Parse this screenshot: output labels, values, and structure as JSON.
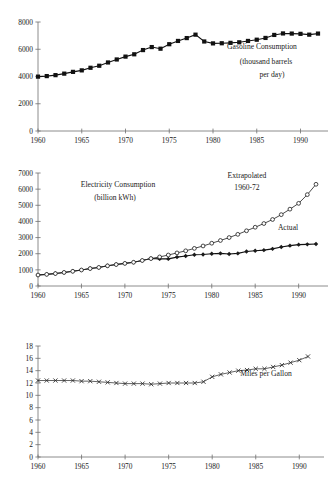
{
  "figure": {
    "title": "",
    "panel_count": 3
  },
  "chart_data": [
    {
      "id": "gasoline",
      "type": "line",
      "title": "Gasoline Consumption",
      "annotations": [
        "Gasoline Consumption",
        "(thousand barrels",
        "per day)"
      ],
      "xlabel": "",
      "ylabel": "",
      "units": "thousand barrels per day",
      "xlim": [
        1960,
        1992
      ],
      "ylim": [
        0,
        8000
      ],
      "xticks": [
        1960,
        1965,
        1970,
        1975,
        1980,
        1985,
        1990
      ],
      "yticks": [
        0,
        2000,
        4000,
        6000,
        8000
      ],
      "grid": false,
      "legend": "none",
      "marker": "filled-square",
      "x": [
        1960,
        1961,
        1962,
        1963,
        1964,
        1965,
        1966,
        1967,
        1968,
        1969,
        1970,
        1971,
        1972,
        1973,
        1974,
        1975,
        1976,
        1977,
        1978,
        1979,
        1980,
        1981,
        1982,
        1983,
        1984,
        1985,
        1986,
        1987,
        1988,
        1989,
        1990,
        1991,
        1992
      ],
      "values": [
        3990,
        4030,
        4100,
        4210,
        4340,
        4450,
        4640,
        4790,
        5030,
        5250,
        5460,
        5630,
        5940,
        6160,
        6040,
        6370,
        6610,
        6820,
        7070,
        6570,
        6430,
        6440,
        6470,
        6510,
        6610,
        6700,
        6830,
        7050,
        7160,
        7150,
        7130,
        7070,
        7150
      ]
    },
    {
      "id": "electricity",
      "type": "line",
      "title": "Electricity Consumption",
      "annotations": [
        "Electricity Consumption",
        "(billion kWh)",
        "Extrapolated",
        "1960-72",
        "Actual"
      ],
      "xlabel": "",
      "ylabel": "",
      "units": "billion kWh",
      "xlim": [
        1960,
        1992
      ],
      "ylim": [
        0,
        7000
      ],
      "xticks": [
        1960,
        1965,
        1970,
        1975,
        1980,
        1985,
        1990
      ],
      "yticks": [
        0,
        1000,
        2000,
        3000,
        4000,
        5000,
        6000,
        7000
      ],
      "grid": false,
      "legend": "inline-labels",
      "x": [
        1960,
        1961,
        1962,
        1963,
        1964,
        1965,
        1966,
        1967,
        1968,
        1969,
        1970,
        1971,
        1972,
        1973,
        1974,
        1975,
        1976,
        1977,
        1978,
        1979,
        1980,
        1981,
        1982,
        1983,
        1984,
        1985,
        1986,
        1987,
        1988,
        1989,
        1990,
        1991,
        1992
      ],
      "series": [
        {
          "name": "Actual",
          "marker": "filled-diamond",
          "values": [
            680,
            720,
            770,
            840,
            910,
            990,
            1080,
            1150,
            1250,
            1330,
            1400,
            1470,
            1580,
            1700,
            1680,
            1680,
            1790,
            1860,
            1940,
            1950,
            2000,
            2020,
            1980,
            2020,
            2140,
            2180,
            2220,
            2300,
            2420,
            2500,
            2560,
            2580,
            2600
          ]
        },
        {
          "name": "Extrapolated 1960-72",
          "marker": "open-circle",
          "values": [
            680,
            720,
            770,
            840,
            910,
            990,
            1080,
            1150,
            1250,
            1330,
            1400,
            1470,
            1580,
            1700,
            1800,
            1920,
            2050,
            2180,
            2330,
            2480,
            2650,
            2820,
            3000,
            3200,
            3420,
            3640,
            3870,
            4120,
            4420,
            4760,
            5120,
            5660,
            6300
          ]
        }
      ]
    },
    {
      "id": "mpg",
      "type": "line",
      "title": "Miles per Gallon",
      "annotations": [
        "Miles per Gallon"
      ],
      "xlabel": "",
      "ylabel": "",
      "units": "miles per gallon",
      "xlim": [
        1960,
        1991
      ],
      "ylim": [
        0,
        18
      ],
      "xticks": [
        1960,
        1965,
        1970,
        1975,
        1980,
        1985,
        1990
      ],
      "yticks": [
        0,
        2,
        4,
        6,
        8,
        10,
        12,
        14,
        16,
        18
      ],
      "grid": false,
      "legend": "none",
      "marker": "cross",
      "x": [
        1960,
        1961,
        1962,
        1963,
        1964,
        1965,
        1966,
        1967,
        1968,
        1969,
        1970,
        1971,
        1972,
        1973,
        1974,
        1975,
        1976,
        1977,
        1978,
        1979,
        1980,
        1981,
        1982,
        1983,
        1984,
        1985,
        1986,
        1987,
        1988,
        1989,
        1990,
        1991
      ],
      "values": [
        12.4,
        12.4,
        12.4,
        12.4,
        12.4,
        12.3,
        12.3,
        12.2,
        12.1,
        12.0,
        11.9,
        11.9,
        11.9,
        11.8,
        11.9,
        12.0,
        12.0,
        12.0,
        12.0,
        12.2,
        13.0,
        13.4,
        13.7,
        14.0,
        14.1,
        14.3,
        14.3,
        14.6,
        14.9,
        15.3,
        15.7,
        16.3
      ]
    }
  ],
  "panels": {
    "gasoline": {
      "annotation_line1": "Gasoline Consumption",
      "annotation_line2": "(thousand barrels",
      "annotation_line3": "per day)",
      "yticklabels": [
        "0",
        "2000",
        "4000",
        "6000",
        "8000"
      ],
      "xticklabels": [
        "1960",
        "1965",
        "1970",
        "1975",
        "1980",
        "1985",
        "1990"
      ]
    },
    "electricity": {
      "annotation_line1": "Electricity Consumption",
      "annotation_line2": "(billion kWh)",
      "annotation_extrap1": "Extrapolated",
      "annotation_extrap2": "1960-72",
      "annotation_actual": "Actual",
      "yticklabels": [
        "0",
        "1000",
        "2000",
        "3000",
        "4000",
        "5000",
        "6000",
        "7000"
      ],
      "xticklabels": [
        "1960",
        "1965",
        "1970",
        "1975",
        "1980",
        "1985",
        "1990"
      ]
    },
    "mpg": {
      "annotation_line1": "Miles per Gallon",
      "yticklabels": [
        "0",
        "2",
        "4",
        "6",
        "8",
        "10",
        "12",
        "14",
        "16",
        "18"
      ],
      "xticklabels": [
        "1960",
        "1965",
        "1970",
        "1975",
        "1980",
        "1985",
        "1990"
      ]
    }
  },
  "colors": {
    "background": "#ffffff",
    "ink": "#1a1a1a",
    "axis": "#6e6e6e",
    "marker_fill": "#111111",
    "marker_open": "#ffffff"
  }
}
